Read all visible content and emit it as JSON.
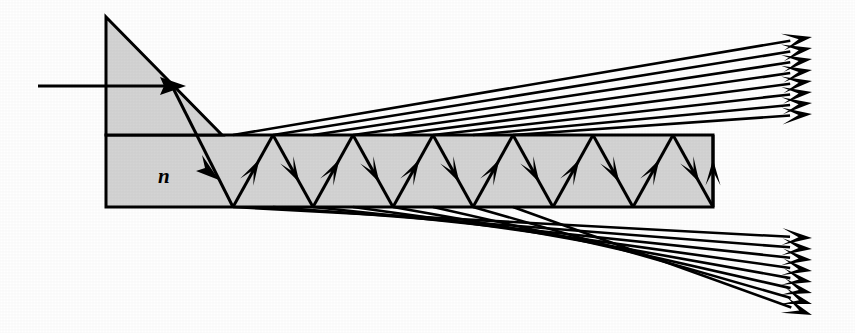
{
  "figure": {
    "background_color": "#ffffff",
    "medium_fill_color": "#d4d4d4",
    "line_color": "#000000"
  },
  "labels": {
    "refractive_index": "n"
  },
  "geometry": {
    "canvas": {
      "width": 855,
      "height": 333
    },
    "prism": {
      "name": "coupling-prism",
      "apex": {
        "x": 106,
        "y": 17
      },
      "left_bottom": {
        "x": 106,
        "y": 135
      },
      "hypotenuse_end": {
        "x": 222,
        "y": 135
      },
      "shape_points": "106,17 222,135 106,135"
    },
    "waveguide": {
      "name": "planar-waveguide-slab",
      "left": 106,
      "top": 135,
      "right": 713,
      "bottom": 207,
      "thickness": 72
    },
    "incident_ray": {
      "start": {
        "x": 38,
        "y": 86
      },
      "end": {
        "x": 175,
        "y": 86
      },
      "arrow_tip": {
        "x": 178,
        "y": 86
      },
      "direction": "horizontal-right"
    },
    "refracted_entry_ray": {
      "start": {
        "x": 170,
        "y": 82
      },
      "end": {
        "x": 233,
        "y": 207
      },
      "arrow_at": {
        "x": 213,
        "y": 167
      }
    },
    "zigzag": {
      "segment_half_period": 40,
      "top_vertices_x": [
        273,
        353,
        433,
        513,
        593,
        673,
        713
      ],
      "bottom_vertices_x": [
        233,
        313,
        393,
        473,
        553,
        633,
        713
      ],
      "top_y": 135,
      "bottom_y": 207,
      "bounce_count_top": 7,
      "bounce_count_bottom": 7
    },
    "output_fan_upper": {
      "name": "upper-output-beam",
      "ray_count": 8,
      "origin_x_values": [
        233,
        273,
        313,
        353,
        393,
        433,
        473,
        513
      ],
      "origin_y": 135,
      "tip_x": 812,
      "tip_y_values": [
        37,
        48,
        59,
        70,
        81,
        92,
        103,
        114
      ],
      "direction": "up-and-to-the-right"
    },
    "output_fan_lower": {
      "name": "lower-output-beam",
      "ray_count": 8,
      "origin_x_values": [
        233,
        273,
        313,
        353,
        393,
        433,
        473,
        513
      ],
      "origin_y": 207,
      "tip_x": 812,
      "tip_y_values": [
        238,
        249,
        260,
        271,
        282,
        293,
        304,
        315
      ],
      "direction": "down-and-to-the-right"
    }
  }
}
